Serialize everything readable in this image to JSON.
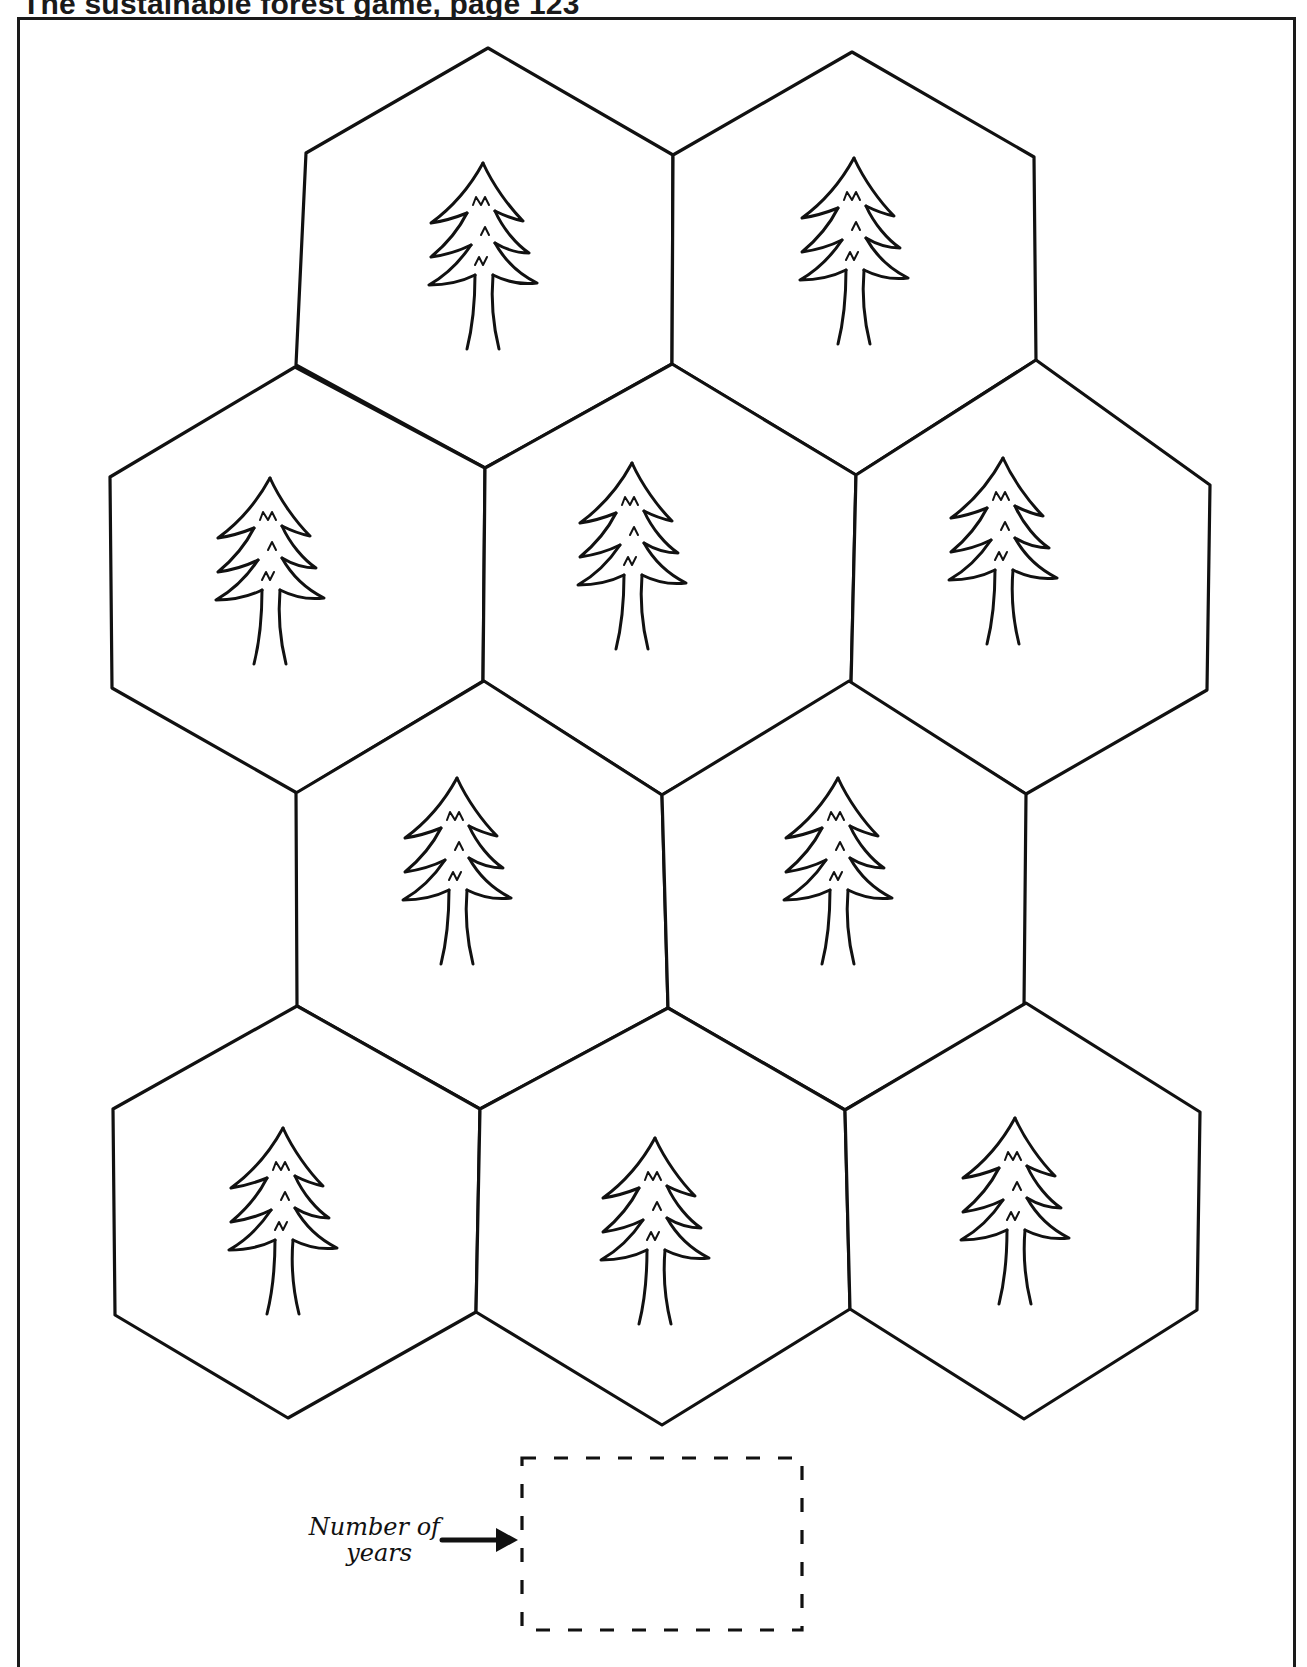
{
  "page": {
    "title": "The sustainable forest game, page 123"
  },
  "board": {
    "tile_icon": "pine-tree-icon",
    "tiles": [
      {
        "id": 1,
        "row": 1,
        "points": [
          [
            488,
            48
          ],
          [
            673,
            155
          ],
          [
            672,
            364
          ],
          [
            485,
            468
          ],
          [
            296,
            365
          ],
          [
            306,
            153
          ]
        ],
        "tree": [
          483,
          255
        ]
      },
      {
        "id": 2,
        "row": 1,
        "points": [
          [
            852,
            52
          ],
          [
            1034,
            157
          ],
          [
            1036,
            360
          ],
          [
            856,
            475
          ],
          [
            672,
            364
          ],
          [
            673,
            155
          ]
        ],
        "tree": [
          854,
          250
        ]
      },
      {
        "id": 3,
        "row": 2,
        "points": [
          [
            295,
            367
          ],
          [
            485,
            468
          ],
          [
            483,
            681
          ],
          [
            297,
            793
          ],
          [
            112,
            688
          ],
          [
            110,
            477
          ]
        ],
        "tree": [
          270,
          570
        ]
      },
      {
        "id": 4,
        "row": 2,
        "points": [
          [
            672,
            364
          ],
          [
            856,
            475
          ],
          [
            851,
            685
          ],
          [
            662,
            795
          ],
          [
            483,
            681
          ],
          [
            485,
            468
          ]
        ],
        "tree": [
          632,
          555
        ]
      },
      {
        "id": 5,
        "row": 2,
        "points": [
          [
            1036,
            360
          ],
          [
            1210,
            485
          ],
          [
            1207,
            690
          ],
          [
            1026,
            794
          ],
          [
            851,
            685
          ],
          [
            856,
            475
          ]
        ],
        "tree": [
          1003,
          550
        ]
      },
      {
        "id": 6,
        "row": 3,
        "points": [
          [
            484,
            681
          ],
          [
            662,
            795
          ],
          [
            668,
            1008
          ],
          [
            480,
            1109
          ],
          [
            297,
            1006
          ],
          [
            296,
            793
          ]
        ],
        "tree": [
          457,
          870
        ]
      },
      {
        "id": 7,
        "row": 3,
        "points": [
          [
            849,
            681
          ],
          [
            1026,
            794
          ],
          [
            1024,
            1006
          ],
          [
            845,
            1110
          ],
          [
            668,
            1008
          ],
          [
            662,
            795
          ]
        ],
        "tree": [
          838,
          870
        ]
      },
      {
        "id": 8,
        "row": 4,
        "points": [
          [
            297,
            1006
          ],
          [
            480,
            1109
          ],
          [
            476,
            1312
          ],
          [
            288,
            1418
          ],
          [
            115,
            1315
          ],
          [
            113,
            1109
          ]
        ],
        "tree": [
          283,
          1220
        ]
      },
      {
        "id": 9,
        "row": 4,
        "points": [
          [
            668,
            1008
          ],
          [
            845,
            1110
          ],
          [
            850,
            1309
          ],
          [
            662,
            1425
          ],
          [
            476,
            1312
          ],
          [
            480,
            1109
          ]
        ],
        "tree": [
          655,
          1230
        ]
      },
      {
        "id": 10,
        "row": 4,
        "points": [
          [
            1026,
            1003
          ],
          [
            1200,
            1112
          ],
          [
            1197,
            1310
          ],
          [
            1024,
            1419
          ],
          [
            850,
            1309
          ],
          [
            845,
            1110
          ]
        ],
        "tree": [
          1015,
          1210
        ]
      }
    ]
  },
  "years_counter": {
    "label_line1": "Number of",
    "label_line2": "years",
    "arrow_icon": "arrow-right-icon",
    "value": ""
  },
  "colors": {
    "ink": "#111111",
    "paper": "#ffffff"
  }
}
